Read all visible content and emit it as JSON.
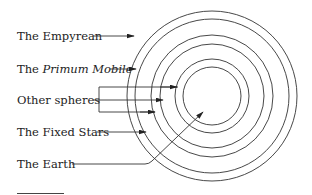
{
  "diagram": {
    "labels": [
      {
        "id": "empyrean",
        "prefix": "The ",
        "text": "Empyrean",
        "italic_part": ""
      },
      {
        "id": "primum-mobile",
        "prefix": "The ",
        "text": "",
        "italic_part": "Primum Mobile"
      },
      {
        "id": "other-spheres",
        "prefix": "",
        "text": "Other spheres",
        "italic_part": ""
      },
      {
        "id": "fixed-stars",
        "prefix": "",
        "text": "The Fixed Stars",
        "italic_part": ""
      },
      {
        "id": "earth",
        "prefix": "",
        "text": "The Earth",
        "italic_part": ""
      }
    ],
    "rings": {
      "center": [
        212,
        96
      ],
      "radii": [
        85,
        77,
        61,
        52,
        37,
        29
      ],
      "stroke": "#333333"
    }
  }
}
